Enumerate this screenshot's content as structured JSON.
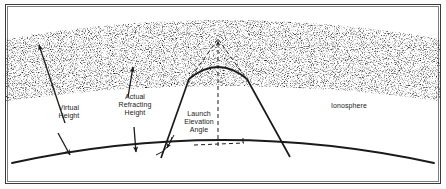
{
  "figure": {
    "type": "diagram",
    "background_color": "#ffffff",
    "ink_color": "#1a1a1a",
    "border_color": "#3a3a3a"
  },
  "labels": {
    "virtual_height": "Virtual\nHeight",
    "actual_refracting_height": "Actual\nRefracting\nHeight",
    "launch_elevation_angle": "Launch\nElevation\nAngle",
    "ionosphere": "Ionosphere"
  },
  "regions": {
    "ionosphere_band": {
      "name": "Ionosphere",
      "fill": "stipple",
      "top_edge": "arched",
      "bottom_edge": "arched"
    },
    "earth_surface": {
      "name": "Earth surface",
      "shape": "convex arc"
    }
  },
  "rays": {
    "actual_path": {
      "name": "Actual refracted ray path",
      "style": "solid",
      "description": "Ray launched from ground, bends within ionosphere, returns to ground"
    },
    "virtual_path": {
      "name": "Virtual ray path extension",
      "style": "dashed",
      "description": "Straight-line extensions meeting at the virtual reflection point"
    },
    "virtual_apex_marker": {
      "name": "Virtual height apex arrow",
      "style": "dashed vertical with arrowhead"
    },
    "horizon_reference": {
      "name": "Local horizontal tangent",
      "style": "dashed"
    }
  },
  "annotations": {
    "virtual_height_arrow": "double-headed leader from Virtual Height label",
    "actual_refracting_height_arrow": "double leader arrows from Actual Refracting Height label",
    "angle_arc": "arc between launch ray and local horizontal"
  }
}
